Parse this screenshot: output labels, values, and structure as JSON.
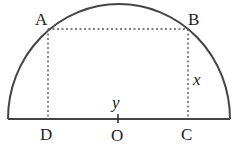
{
  "diagram": {
    "type": "semicircle with inscribed rectangle",
    "points": {
      "A": "A",
      "B": "B",
      "C": "C",
      "D": "D",
      "O": "O"
    },
    "variables": {
      "x": "x",
      "y": "y"
    },
    "colors": {
      "stroke": "#444444",
      "dotted": "#555555"
    }
  }
}
